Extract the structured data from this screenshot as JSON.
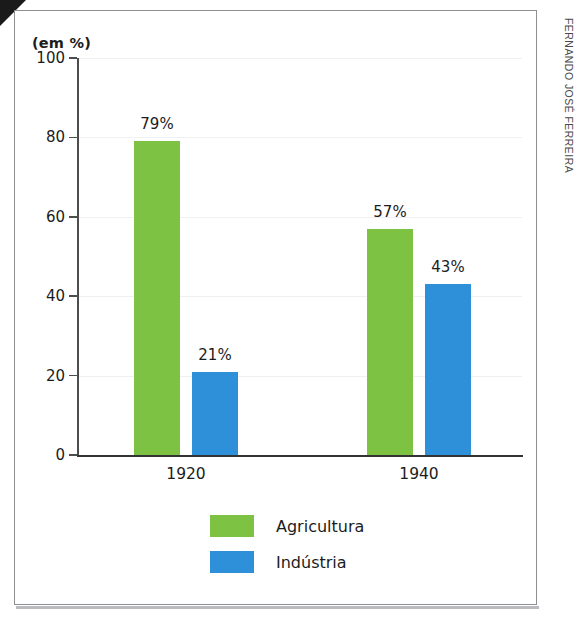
{
  "credit": "FERNANDO JOSÉ FERREIRA",
  "axis_title": "(em %)",
  "legend": {
    "items": [
      {
        "label": "Agricultura",
        "color": "#7dc242",
        "swatch": "green-swatch"
      },
      {
        "label": "Indústria",
        "color": "#2e90d8",
        "swatch": "blue-swatch"
      }
    ]
  },
  "chart_data": {
    "type": "bar",
    "title": "",
    "subtitle": "",
    "xlabel": "",
    "ylabel": "(em %)",
    "categories": [
      "1920",
      "1940"
    ],
    "series": [
      {
        "name": "Agricultura",
        "color": "#7dc242",
        "values": [
          79,
          57
        ],
        "labels": [
          "79%",
          "57%"
        ]
      },
      {
        "name": "Indústria",
        "color": "#2e90d8",
        "values": [
          21,
          43
        ],
        "labels": [
          "21%",
          "43%"
        ]
      }
    ],
    "ylim": [
      0,
      100
    ],
    "yticks": [
      0,
      20,
      40,
      60,
      80,
      100
    ],
    "ytick_labels": [
      "0",
      "20",
      "40",
      "60",
      "80",
      "100"
    ],
    "grid": true,
    "grid_axis": "y",
    "legend_position": "bottom-center",
    "bar_value_labels": true
  }
}
